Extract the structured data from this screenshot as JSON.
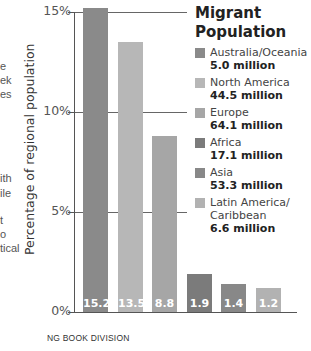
{
  "page_fragments": [
    {
      "text": "e",
      "top": 61
    },
    {
      "text": "ek",
      "top": 75
    },
    {
      "text": "es",
      "top": 89
    },
    {
      "text": "ith",
      "top": 173
    },
    {
      "text": "ile",
      "top": 188
    },
    {
      "text": "t",
      "top": 215
    },
    {
      "text": "o",
      "top": 229
    },
    {
      "text": "tical",
      "top": 243
    }
  ],
  "chart_data": {
    "type": "bar",
    "title": "Migrant Population",
    "xlabel": "",
    "ylabel": "Percentage of regional population",
    "ylim": [
      0,
      15
    ],
    "yticks": [
      "0%",
      "5%",
      "10%",
      "15%"
    ],
    "grid": true,
    "legend_position": "right",
    "categories": [
      "Australia/Oceania",
      "North America",
      "Europe",
      "Africa",
      "Asia",
      "Latin America/Caribbean"
    ],
    "values": [
      15.2,
      13.5,
      8.8,
      1.9,
      1.4,
      1.2
    ],
    "value_labels": [
      "15.2",
      "13.5",
      "8.8",
      "1.9",
      "1.4",
      "1.2"
    ],
    "legend": [
      {
        "name": "Australia/Oceania",
        "value": "5.0 million",
        "color": "#8a8a8a"
      },
      {
        "name": "North America",
        "value": "44.5 million",
        "color": "#b7b7b7"
      },
      {
        "name": "Europe",
        "value": "64.1 million",
        "color": "#a6a6a6"
      },
      {
        "name": "Africa",
        "value": "17.1 million",
        "color": "#7b7b7b"
      },
      {
        "name": "Asia",
        "value": "53.3 million",
        "color": "#888888"
      },
      {
        "name": "Latin America/ Caribbean",
        "value": "6.6 million",
        "color": "#b2b2b2"
      }
    ]
  },
  "source": "NG BOOK DIVISION"
}
